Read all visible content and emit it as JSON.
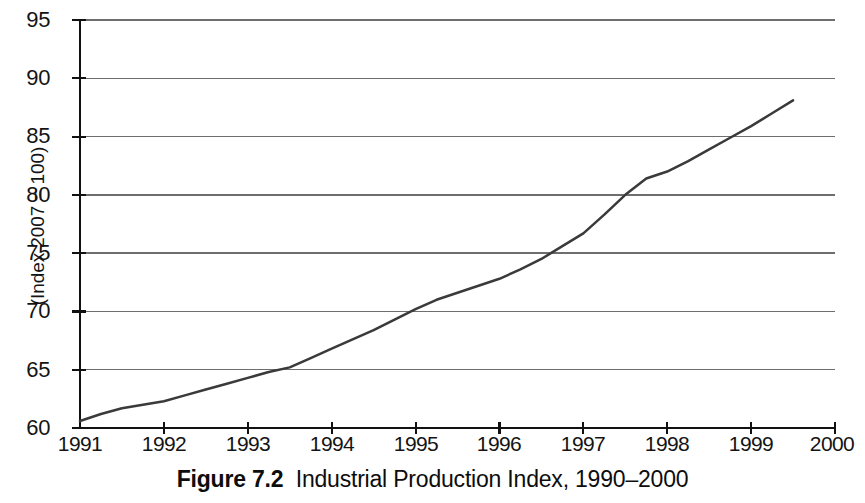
{
  "caption": {
    "label": "Figure 7.2",
    "text": "Industrial Production Index, 1990–2000"
  },
  "axis": {
    "y_title": "(Index 2007 = 100)",
    "y_ticks": [
      "95",
      "90",
      "85",
      "80",
      "75",
      "70",
      "65",
      "60"
    ],
    "x_ticks": [
      "1991",
      "1992",
      "1993",
      "1994",
      "1995",
      "1996",
      "1997",
      "1998",
      "1999",
      "2000"
    ]
  },
  "colors": {
    "line": "#3a3a3a",
    "grid": "#6e6e6e",
    "axis": "#111111",
    "background": "#ffffff"
  },
  "chart_data": {
    "type": "line",
    "title": "Industrial Production Index, 1990–2000",
    "xlabel": "",
    "ylabel": "(Index 2007 = 100)",
    "xlim": [
      1991,
      2000
    ],
    "ylim": [
      60,
      95
    ],
    "ytick_interval": 5,
    "grid": "horizontal",
    "legend": "none",
    "series": [
      {
        "name": "Industrial Production Index",
        "x": [
          1991.0,
          1991.25,
          1991.5,
          1991.75,
          1992.0,
          1992.25,
          1992.5,
          1992.75,
          1993.0,
          1993.25,
          1993.5,
          1993.75,
          1994.0,
          1994.25,
          1994.5,
          1994.75,
          1995.0,
          1995.25,
          1995.5,
          1995.75,
          1996.0,
          1996.25,
          1996.5,
          1996.75,
          1997.0,
          1997.25,
          1997.5,
          1997.75,
          1998.0,
          1998.25,
          1998.5,
          1998.75,
          1999.0,
          1999.25,
          1999.5
        ],
        "y": [
          60.6,
          61.2,
          61.7,
          62.0,
          62.3,
          62.8,
          63.3,
          63.8,
          64.3,
          64.8,
          65.2,
          66.0,
          66.8,
          67.6,
          68.4,
          69.3,
          70.2,
          71.0,
          71.6,
          72.2,
          72.8,
          73.6,
          74.5,
          75.6,
          76.7,
          78.3,
          80.0,
          81.4,
          82.0,
          82.9,
          83.9,
          84.9,
          85.9,
          87.0,
          88.1
        ]
      }
    ],
    "annotations": [
      "Monotonically rising index from about 60.6 in 1991 to about 89.2 in mid-1999",
      "Slope steepens noticeably between 1996 and mid-1997",
      "Slight flattening of slope just after 1997.5"
    ],
    "endpoint_value": 89.2,
    "start_value": 60.6
  }
}
